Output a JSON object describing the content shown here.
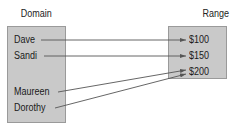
{
  "diagram": {
    "domain": {
      "title": "Domain",
      "items": [
        {
          "label": "Dave",
          "y": 40
        },
        {
          "label": "Sandi",
          "y": 56
        },
        {
          "label": "Maureen",
          "y": 92
        },
        {
          "label": "Dorothy",
          "y": 108
        }
      ]
    },
    "range": {
      "title": "Range",
      "items": [
        {
          "label": "$100",
          "y": 40
        },
        {
          "label": "$150",
          "y": 56
        },
        {
          "label": "$200",
          "y": 72
        }
      ]
    },
    "mappings": [
      {
        "from": "Dave",
        "to": "$100"
      },
      {
        "from": "Sandi",
        "to": "$150"
      },
      {
        "from": "Maureen",
        "to": "$200"
      },
      {
        "from": "Dorothy",
        "to": "$200"
      }
    ],
    "colors": {
      "box_fill": "#c9c9c9",
      "box_border": "#9a9a9a",
      "arrow": "#555555",
      "text": "#1a1a1a"
    }
  }
}
